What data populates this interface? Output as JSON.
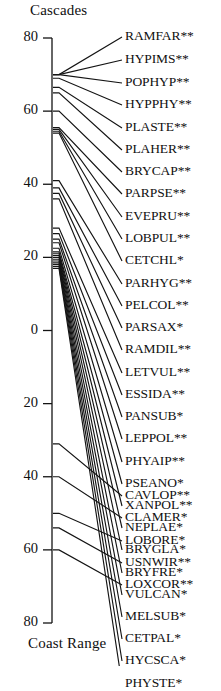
{
  "chart_data": {
    "type": "line",
    "title": "",
    "subtitle": "",
    "top_axis_label": "Cascades",
    "bottom_axis_label": "Coast Range",
    "ylabel": "",
    "xlabel": "",
    "grid": false,
    "legend": "none",
    "axis": {
      "orientation": "vertical",
      "tick_labels": [
        "80",
        "60",
        "40",
        "20",
        "0",
        "20",
        "40",
        "60",
        "80"
      ],
      "tick_values": [
        80,
        60,
        40,
        20,
        0,
        -20,
        -40,
        -60,
        -80
      ],
      "tick_pixel_y": [
        38,
        130,
        222,
        314,
        404,
        496,
        588,
        680,
        623
      ],
      "range_top": 80,
      "range_bottom": -80,
      "note": "Single vertical axis; values above 0 are Cascades side, below 0 mirror to Coast Range"
    },
    "series_description": "Each line connects a species' axis position (left anchor) to its text label (right).",
    "points": [
      {
        "label": "RAMFAR**",
        "significance": "**",
        "axis_y": 70.0,
        "left_px": 83,
        "right_px": 37
      },
      {
        "label": "HYPIMS**",
        "significance": "**",
        "axis_y": 70.0,
        "left_px": 83,
        "right_px": 60
      },
      {
        "label": "POPHYP**",
        "significance": "**",
        "axis_y": 70.0,
        "left_px": 83,
        "right_px": 83
      },
      {
        "label": "HYPPHY**",
        "significance": "**",
        "axis_y": 69.0,
        "left_px": 86,
        "right_px": 105
      },
      {
        "label": "PLASTE**",
        "significance": "**",
        "axis_y": 66.5,
        "left_px": 97,
        "right_px": 128
      },
      {
        "label": "PLAHER**",
        "significance": "**",
        "axis_y": 65.0,
        "left_px": 104,
        "right_px": 150
      },
      {
        "label": "BRYCAP**",
        "significance": "**",
        "axis_y": 60.0,
        "left_px": 126,
        "right_px": 172
      },
      {
        "label": "PARPSE**",
        "significance": "**",
        "axis_y": 55.5,
        "left_px": 147,
        "right_px": 194
      },
      {
        "label": "EVEPRU**",
        "significance": "**",
        "axis_y": 55.0,
        "left_px": 149,
        "right_px": 217
      },
      {
        "label": "LOBPUL**",
        "significance": "**",
        "axis_y": 54.5,
        "left_px": 151,
        "right_px": 239
      },
      {
        "label": "CETCHL*",
        "significance": "*",
        "axis_y": 54.0,
        "left_px": 153,
        "right_px": 261
      },
      {
        "label": "PARHYG**",
        "significance": "**",
        "axis_y": 41.0,
        "left_px": 213,
        "right_px": 284
      },
      {
        "label": "PELCOL**",
        "significance": "**",
        "axis_y": 39.0,
        "left_px": 222,
        "right_px": 306
      },
      {
        "label": "PARSAX*",
        "significance": "*",
        "axis_y": 37.5,
        "left_px": 229,
        "right_px": 328
      },
      {
        "label": "RAMDIL**",
        "significance": "**",
        "axis_y": 36.0,
        "left_px": 236,
        "right_px": 350
      },
      {
        "label": "LETVUL**",
        "significance": "**",
        "axis_y": 28.0,
        "left_px": 273,
        "right_px": 373
      },
      {
        "label": "ESSIDA**",
        "significance": "**",
        "axis_y": 26.5,
        "left_px": 280,
        "right_px": 395
      },
      {
        "label": "PANSUB*",
        "significance": "*",
        "axis_y": 25.0,
        "left_px": 287,
        "right_px": 417
      },
      {
        "label": "LEPPOL**",
        "significance": "**",
        "axis_y": 24.0,
        "left_px": 291,
        "right_px": 439
      },
      {
        "label": "PHYAIP**",
        "significance": "**",
        "axis_y": 22.5,
        "left_px": 298,
        "right_px": 462
      },
      {
        "label": "PSEANO*",
        "significance": "*",
        "axis_y": 21.5,
        "left_px": 303,
        "right_px": 484
      },
      {
        "label": "XANPOL**",
        "significance": "**",
        "axis_y": 21.0,
        "left_px": 305,
        "right_px": 506
      },
      {
        "label": "NEPLAE*",
        "significance": "*",
        "axis_y": 20.5,
        "left_px": 307,
        "right_px": 528
      },
      {
        "label": "BRYGLA*",
        "significance": "*",
        "axis_y": 20.0,
        "left_px": 310,
        "right_px": 550
      },
      {
        "label": "BRYFRE*",
        "significance": "*",
        "axis_y": 19.5,
        "left_px": 312,
        "right_px": 573
      },
      {
        "label": "VULCAN*",
        "significance": "*",
        "axis_y": 19.0,
        "left_px": 314,
        "right_px": 595
      },
      {
        "label": "MELSUB*",
        "significance": "*",
        "axis_y": 18.5,
        "left_px": 317,
        "right_px": 617
      },
      {
        "label": "CETPAL*",
        "significance": "*",
        "axis_y": 18.0,
        "left_px": 319,
        "right_px": 639
      },
      {
        "label": "HYCSCA*",
        "significance": "*",
        "axis_y": 17.5,
        "left_px": 321,
        "right_px": 661
      },
      {
        "label": "PHYSTE*",
        "significance": "*",
        "axis_y": 17.0,
        "left_px": 323,
        "right_px": 684
      },
      {
        "label": "CAVLOP**",
        "significance": "**",
        "axis_y": -31.0,
        "left_px": 446,
        "right_px": 496
      },
      {
        "label": "CLAMER*",
        "significance": "*",
        "axis_y": -40.0,
        "left_px": 487,
        "right_px": 518
      },
      {
        "label": "LOBORE*",
        "significance": "*",
        "axis_y": -50.0,
        "left_px": 533,
        "right_px": 541
      },
      {
        "label": "USNWIR**",
        "significance": "**",
        "axis_y": -54.0,
        "left_px": 551,
        "right_px": 563
      },
      {
        "label": "LOXCOR**",
        "significance": "**",
        "axis_y": -60.0,
        "left_px": 578,
        "right_px": 585
      }
    ]
  }
}
